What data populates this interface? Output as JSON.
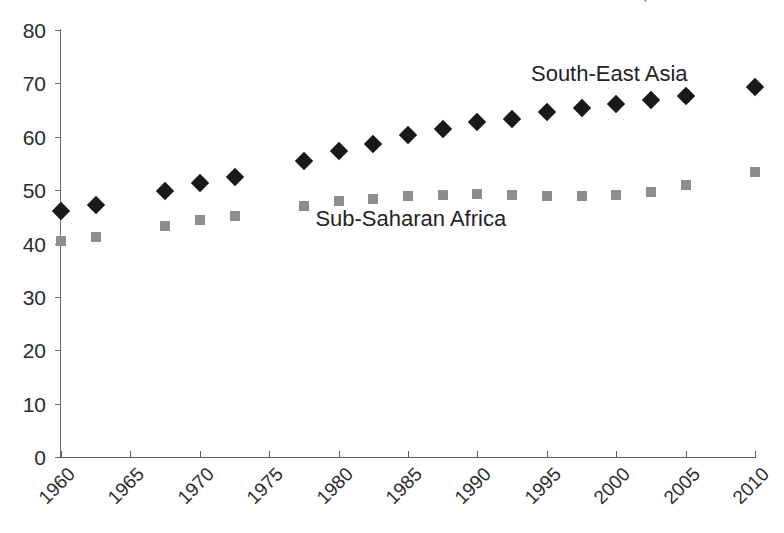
{
  "title_remnant": "· · ·   · · ·   · · · ·   | ·",
  "chart_data": {
    "type": "scatter",
    "title": "",
    "xlabel": "",
    "ylabel": "",
    "xlim": [
      1960,
      2010
    ],
    "ylim": [
      0,
      80
    ],
    "grid": false,
    "legend_position": "inline-annotation",
    "y_ticks": [
      0,
      10,
      20,
      30,
      40,
      50,
      60,
      70,
      80
    ],
    "x_ticks": [
      1960,
      1965,
      1970,
      1975,
      1980,
      1985,
      1990,
      1995,
      2000,
      2005,
      2010
    ],
    "x_tick_labels": [
      "1960",
      "1965",
      "1970",
      "1975",
      "1980",
      "1985",
      "1990",
      "1995",
      "2000",
      "2005",
      "2010"
    ],
    "y_tick_labels": [
      "0",
      "10",
      "20",
      "30",
      "40",
      "50",
      "60",
      "70",
      "80"
    ],
    "series": [
      {
        "name": "South-East Asia",
        "marker": "diamond",
        "color": "#19191b",
        "label_x": 1999.5,
        "label_y": 71.8,
        "points": [
          {
            "x": 1960.0,
            "y": 46.1
          },
          {
            "x": 1962.5,
            "y": 47.2
          },
          {
            "x": 1967.5,
            "y": 49.9
          },
          {
            "x": 1970.0,
            "y": 51.4
          },
          {
            "x": 1972.5,
            "y": 52.5
          },
          {
            "x": 1977.5,
            "y": 55.4
          },
          {
            "x": 1980.0,
            "y": 57.3
          },
          {
            "x": 1982.5,
            "y": 58.6
          },
          {
            "x": 1985.0,
            "y": 60.3
          },
          {
            "x": 1987.5,
            "y": 61.4
          },
          {
            "x": 1990.0,
            "y": 62.7
          },
          {
            "x": 1992.5,
            "y": 63.4
          },
          {
            "x": 1995.0,
            "y": 64.7
          },
          {
            "x": 1997.5,
            "y": 65.3
          },
          {
            "x": 2000.0,
            "y": 66.1
          },
          {
            "x": 2002.5,
            "y": 66.8
          },
          {
            "x": 2005.0,
            "y": 67.7
          },
          {
            "x": 2010.0,
            "y": 69.4
          }
        ]
      },
      {
        "name": "Sub-Saharan Africa",
        "marker": "square",
        "color": "#8d8d90",
        "label_x": 1985.2,
        "label_y": 44.6,
        "points": [
          {
            "x": 1960.0,
            "y": 40.5
          },
          {
            "x": 1962.5,
            "y": 41.3
          },
          {
            "x": 1967.5,
            "y": 43.3
          },
          {
            "x": 1970.0,
            "y": 44.4
          },
          {
            "x": 1972.5,
            "y": 45.2
          },
          {
            "x": 1977.5,
            "y": 47.0
          },
          {
            "x": 1980.0,
            "y": 47.9
          },
          {
            "x": 1982.5,
            "y": 48.3
          },
          {
            "x": 1985.0,
            "y": 48.9
          },
          {
            "x": 1987.5,
            "y": 49.1
          },
          {
            "x": 1990.0,
            "y": 49.2
          },
          {
            "x": 1992.5,
            "y": 49.0
          },
          {
            "x": 1995.0,
            "y": 48.9
          },
          {
            "x": 1997.5,
            "y": 48.9
          },
          {
            "x": 2000.0,
            "y": 49.0
          },
          {
            "x": 2002.5,
            "y": 49.6
          },
          {
            "x": 2005.0,
            "y": 50.9
          },
          {
            "x": 2010.0,
            "y": 53.4
          }
        ]
      }
    ]
  }
}
